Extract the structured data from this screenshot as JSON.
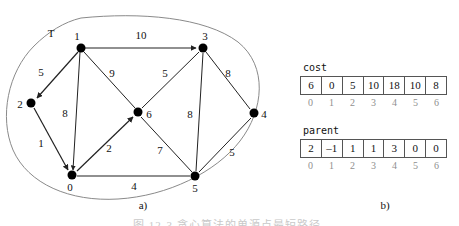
{
  "figure": {
    "panel_a_caption": "a)",
    "panel_b_caption": "b)",
    "bottom_caption": "图 12-3   贪心算法的单源点最短路径"
  },
  "graph": {
    "tree_set_label": "T",
    "nodes": [
      {
        "id": "1",
        "x": 81,
        "y": 48,
        "label_dx": -4,
        "label_dy": -12
      },
      {
        "id": "3",
        "x": 203,
        "y": 48,
        "label_dx": 2,
        "label_dy": -12
      },
      {
        "id": "2",
        "x": 31,
        "y": 103,
        "label_dx": -11,
        "label_dy": 1
      },
      {
        "id": "6",
        "x": 138,
        "y": 112,
        "label_dx": 11,
        "label_dy": 2
      },
      {
        "id": "4",
        "x": 254,
        "y": 113,
        "label_dx": 10,
        "label_dy": 1
      },
      {
        "id": "0",
        "x": 72,
        "y": 175,
        "label_dx": -2,
        "label_dy": 12
      },
      {
        "id": "5",
        "x": 195,
        "y": 176,
        "label_dx": 0,
        "label_dy": 12
      }
    ],
    "edges": [
      {
        "from": "1",
        "to": "3",
        "weight": "10",
        "directed": true,
        "lx": 141,
        "ly": 35
      },
      {
        "from": "1",
        "to": "2",
        "weight": "5",
        "directed": true,
        "lx": 41,
        "ly": 72
      },
      {
        "from": "1",
        "to": "0",
        "weight": "8",
        "directed": false,
        "lx": 65,
        "ly": 113
      },
      {
        "from": "1",
        "to": "6",
        "weight": "9",
        "directed": false,
        "lx": 112,
        "ly": 73
      },
      {
        "from": "2",
        "to": "0",
        "weight": "1",
        "directed": true,
        "lx": 41,
        "ly": 143
      },
      {
        "from": "3",
        "to": "6",
        "weight": "5",
        "directed": false,
        "lx": 165,
        "ly": 73
      },
      {
        "from": "3",
        "to": "4",
        "weight": "8",
        "directed": false,
        "lx": 228,
        "ly": 73
      },
      {
        "from": "3",
        "to": "5",
        "weight": "8",
        "directed": false,
        "lx": 190,
        "ly": 114
      },
      {
        "from": "0",
        "to": "6",
        "weight": "2",
        "directed": true,
        "lx": 109,
        "ly": 148
      },
      {
        "from": "6",
        "to": "5",
        "weight": "7",
        "directed": false,
        "lx": 160,
        "ly": 150
      },
      {
        "from": "0",
        "to": "5",
        "weight": "4",
        "directed": false,
        "lx": 134,
        "ly": 186
      },
      {
        "from": "4",
        "to": "5",
        "weight": "5",
        "directed": false,
        "lx": 232,
        "ly": 152
      }
    ]
  },
  "arrays": [
    {
      "key": "cost",
      "title": "cost",
      "values": [
        "6",
        "0",
        "5",
        "10",
        "18",
        "10",
        "8"
      ],
      "indices": [
        "0",
        "1",
        "2",
        "3",
        "4",
        "5",
        "6"
      ]
    },
    {
      "key": "parent",
      "title": "parent",
      "values": [
        "2",
        "–1",
        "1",
        "1",
        "3",
        "0",
        "0"
      ],
      "indices": [
        "0",
        "1",
        "2",
        "3",
        "4",
        "5",
        "6"
      ]
    }
  ],
  "colors": {
    "node_fill": "#000000",
    "edge_stroke": "#222222",
    "set_outline": "#8a8a8a",
    "table_border": "#555555",
    "index_text": "#8f8f8f"
  }
}
